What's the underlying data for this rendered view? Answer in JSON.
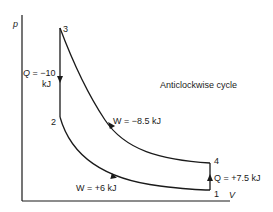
{
  "diagram": {
    "title": "Anticlockwise cycle",
    "axes": {
      "y_label": "p",
      "x_label": "V"
    },
    "points": [
      {
        "id": "1",
        "label": "1"
      },
      {
        "id": "2",
        "label": "2"
      },
      {
        "id": "3",
        "label": "3"
      },
      {
        "id": "4",
        "label": "4"
      }
    ],
    "processes": [
      {
        "from": "3",
        "to": "2",
        "label_line1": "Q = −10",
        "label_line2": "kJ"
      },
      {
        "from": "2",
        "to": "1",
        "label": "W = +6 kJ"
      },
      {
        "from": "1",
        "to": "4",
        "label": "Q = +7.5 kJ"
      },
      {
        "from": "4",
        "to": "3",
        "label": "W = −8.5 kJ"
      }
    ],
    "colors": {
      "line": "#1a1a1a",
      "background": "#ffffff"
    }
  }
}
